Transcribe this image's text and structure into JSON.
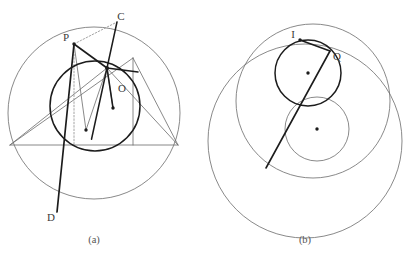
{
  "figure": {
    "background": "#ffffff",
    "stroke_thin": "#6b6b6b",
    "stroke_thick": "#1c1c1c",
    "stroke_dotted": "#9a9a9a",
    "label_color": "#3a3a3a",
    "caption_color": "#555555"
  },
  "panel_a": {
    "caption": "(a)",
    "labels": {
      "p": "P",
      "c": "C",
      "d": "D",
      "o": "O"
    },
    "outer_circle": {
      "cx": 94,
      "cy": 113,
      "r": 86
    },
    "inner_circle": {
      "cx": 95,
      "cy": 106,
      "r": 45
    },
    "points": {
      "P": {
        "x": 74,
        "y": 44
      },
      "C": {
        "x": 117,
        "y": 22
      },
      "D": {
        "x": 57,
        "y": 212
      },
      "hub": {
        "x": 107,
        "y": 68
      },
      "tri_left": {
        "x": 10,
        "y": 145
      },
      "tri_right": {
        "x": 178,
        "y": 145
      },
      "tri_apex": {
        "x": 133,
        "y": 58
      },
      "center_marker_1": {
        "x": 86,
        "y": 130
      },
      "center_marker_2": {
        "x": 113,
        "y": 108
      },
      "foot_vertical": {
        "x": 133,
        "y": 145
      }
    }
  },
  "panel_b": {
    "caption": "(b)",
    "labels": {
      "i": "I",
      "q": "Q"
    },
    "outer_circle": {
      "cx": 305,
      "cy": 141,
      "r": 97
    },
    "medium_circle": {
      "cx": 313,
      "cy": 101,
      "r": 77
    },
    "upper_circle": {
      "cx": 308,
      "cy": 73,
      "r": 33
    },
    "lower_circle": {
      "cx": 317,
      "cy": 129,
      "r": 32
    },
    "points": {
      "I": {
        "x": 300,
        "y": 40
      },
      "Q": {
        "x": 330,
        "y": 51
      },
      "chord_end": {
        "x": 266,
        "y": 168
      },
      "center_marker_upper": {
        "x": 308,
        "y": 73
      },
      "center_marker_lower": {
        "x": 317,
        "y": 129
      }
    }
  }
}
